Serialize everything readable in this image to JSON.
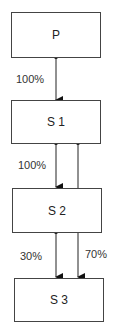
{
  "nodes": [
    {
      "id": "P",
      "label": "P"
    },
    {
      "id": "S1",
      "label": "S 1"
    },
    {
      "id": "S2",
      "label": "S 2"
    },
    {
      "id": "S3",
      "label": "S 3"
    }
  ],
  "edges": [
    {
      "from": "P",
      "to": "S1",
      "label": "100%"
    },
    {
      "from": "S1",
      "to": "S2",
      "label": "100%"
    },
    {
      "from": "S2",
      "to": "S3",
      "label": "30%"
    },
    {
      "from": "S1",
      "to": "S3",
      "label": "70%"
    }
  ]
}
